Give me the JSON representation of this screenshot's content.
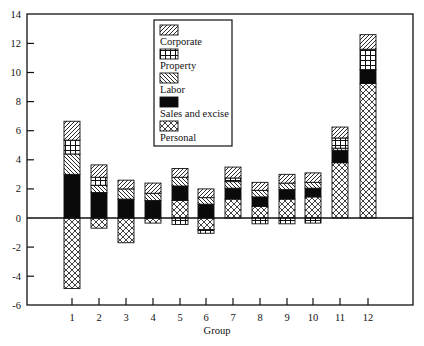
{
  "chart_data": {
    "type": "bar",
    "stacked": true,
    "title": "",
    "xlabel": "Group",
    "ylabel": "",
    "ylim": [
      -6,
      14
    ],
    "yticks": [
      14,
      12,
      10,
      8,
      6,
      4,
      2,
      0,
      -2,
      -4,
      -6
    ],
    "categories": [
      "1",
      "2",
      "3",
      "4",
      "5",
      "6",
      "7",
      "8",
      "9",
      "10",
      "11",
      "12"
    ],
    "legend": {
      "position": "upper center (inside plot)",
      "entries": [
        "Corporate",
        "Property",
        "Labor",
        "Sales and excise",
        "Personal"
      ]
    },
    "grid": false,
    "series": [
      {
        "name": "Personal",
        "pattern": "crosshatch-diamond",
        "values": [
          -4.85,
          -0.7,
          -1.7,
          -0.35,
          1.2,
          -0.8,
          1.3,
          0.8,
          1.3,
          1.45,
          3.8,
          9.25
        ]
      },
      {
        "name": "Sales and excise",
        "pattern": "solid-black",
        "values": [
          3.0,
          1.75,
          1.3,
          1.2,
          1.0,
          0.95,
          0.75,
          0.65,
          0.65,
          0.6,
          0.85,
          0.95
        ]
      },
      {
        "name": "Labor",
        "pattern": "back-diagonal",
        "values": [
          1.4,
          0.5,
          0.7,
          0.5,
          0.6,
          0.45,
          0.45,
          0.45,
          0.45,
          0.4,
          0.15,
          0.0
        ]
      },
      {
        "name": "Property",
        "pattern": "grid",
        "values": [
          0.95,
          0.55,
          0.0,
          0.0,
          -0.45,
          -0.25,
          0.25,
          -0.4,
          -0.4,
          -0.35,
          0.7,
          1.4
        ]
      },
      {
        "name": "Corporate",
        "pattern": "forward-diagonal",
        "values": [
          1.3,
          0.85,
          0.6,
          0.7,
          0.6,
          0.6,
          0.75,
          0.55,
          0.6,
          0.65,
          0.75,
          1.0
        ]
      }
    ],
    "bar_extents": [
      {
        "group": "1",
        "top": 6.65,
        "bottom": -4.85
      },
      {
        "group": "2",
        "top": 3.65,
        "bottom": -0.7
      },
      {
        "group": "3",
        "top": 2.6,
        "bottom": -1.7
      },
      {
        "group": "4",
        "top": 2.4,
        "bottom": -0.35
      },
      {
        "group": "5",
        "top": 3.4,
        "bottom": -0.45
      },
      {
        "group": "6",
        "top": 2.0,
        "bottom": -1.05
      },
      {
        "group": "7",
        "top": 3.5,
        "bottom": 0
      },
      {
        "group": "8",
        "top": 2.45,
        "bottom": -0.4
      },
      {
        "group": "9",
        "top": 3.0,
        "bottom": -0.4
      },
      {
        "group": "10",
        "top": 3.1,
        "bottom": -0.35
      },
      {
        "group": "11",
        "top": 6.25,
        "bottom": 0
      },
      {
        "group": "12",
        "top": 12.6,
        "bottom": 0
      }
    ]
  },
  "colors": {
    "ink": "#111111",
    "background": "#ffffff"
  }
}
